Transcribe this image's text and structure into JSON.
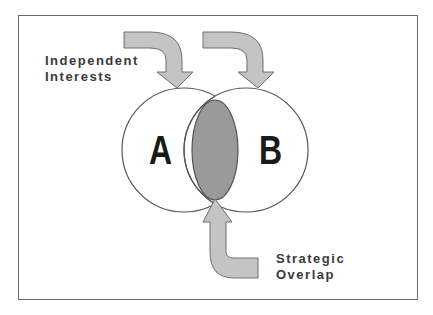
{
  "diagram": {
    "type": "venn",
    "sets": [
      {
        "id": "A",
        "label": "A"
      },
      {
        "id": "B",
        "label": "B"
      }
    ],
    "overlap": {
      "label": "Strategic Overlap",
      "fill": "#9a9a9a"
    },
    "annotations": {
      "independent": {
        "line1": "Independent",
        "line2": "Interests"
      },
      "overlap": {
        "line1": "Strategic",
        "line2": "Overlap"
      }
    },
    "colors": {
      "arrow_fill": "#c4c4c4",
      "arrow_stroke": "#6e6e6e",
      "overlap_fill": "#9a9a9a",
      "circle_stroke": "#555555",
      "frame_border": "#6a6a6a"
    }
  }
}
